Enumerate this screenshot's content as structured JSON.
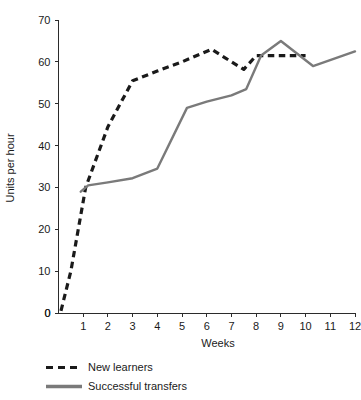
{
  "chart_data": {
    "type": "line",
    "title": "",
    "xlabel": "Weeks",
    "ylabel": "Units per hour",
    "xlim": [
      0,
      12
    ],
    "ylim": [
      0,
      70
    ],
    "xticks": [
      0,
      1,
      2,
      3,
      4,
      5,
      6,
      7,
      8,
      9,
      10,
      11,
      12
    ],
    "xticklabels": [
      "0",
      "1",
      "2",
      "3",
      "4",
      "5",
      "6",
      "7",
      "8",
      "9",
      "10",
      "11",
      "12"
    ],
    "yticks": [
      0,
      10,
      20,
      30,
      40,
      50,
      60,
      70
    ],
    "yticklabels": [
      "0",
      "10",
      "20",
      "30",
      "40",
      "50",
      "60",
      "70"
    ],
    "grid": false,
    "legend_position": "below-left",
    "series": [
      {
        "name": "New learners",
        "style": "dashed",
        "color": "#1a1a1a",
        "x": [
          0.1,
          0.5,
          1.1,
          2.0,
          3.0,
          4.0,
          5.0,
          6.2,
          7.0,
          7.5,
          8.0,
          9.0,
          10.0
        ],
        "y": [
          0.5,
          10.0,
          30.0,
          44.5,
          55.5,
          57.8,
          60.0,
          63.0,
          60.0,
          58.2,
          61.5,
          61.5,
          61.5
        ]
      },
      {
        "name": "Successful transfers",
        "style": "solid",
        "color": "#7a7a7a",
        "x": [
          0.9,
          1.2,
          2.0,
          3.0,
          4.0,
          5.2,
          6.0,
          7.0,
          7.6,
          8.2,
          9.0,
          10.3,
          12.0
        ],
        "y": [
          29.0,
          30.5,
          31.2,
          32.2,
          34.5,
          49.0,
          50.5,
          52.0,
          53.5,
          61.5,
          65.0,
          59.0,
          62.5
        ]
      }
    ]
  },
  "legend": {
    "items": [
      {
        "label": "New learners",
        "style": "dashed",
        "color": "#1a1a1a"
      },
      {
        "label": "Successful transfers",
        "style": "solid",
        "color": "#7a7a7a"
      }
    ]
  }
}
